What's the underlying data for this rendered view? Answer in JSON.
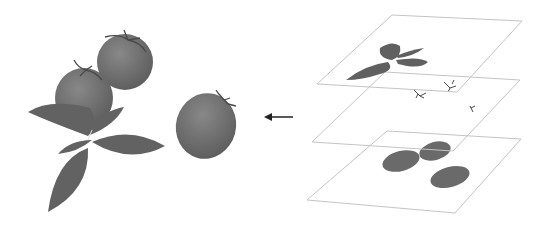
{
  "figure": {
    "left_panel": {
      "label": "composite-scene",
      "objects": [
        "tomato",
        "tomato",
        "tomato",
        "basil-leaves"
      ]
    },
    "arrow": {
      "direction": "left"
    },
    "right_panel": {
      "label": "layer-stack",
      "layers": [
        {
          "name": "top-layer",
          "content": "basil-leaves"
        },
        {
          "name": "middle-layer",
          "content": "tomato-stems"
        },
        {
          "name": "bottom-layer",
          "content": "tomato-bodies"
        }
      ]
    },
    "colors": {
      "object_fill": "#6e6e6e",
      "object_dark": "#5a5a5a",
      "plane_stroke": "#c4c4c4",
      "arrow": "#222222",
      "background": "#ffffff"
    }
  }
}
